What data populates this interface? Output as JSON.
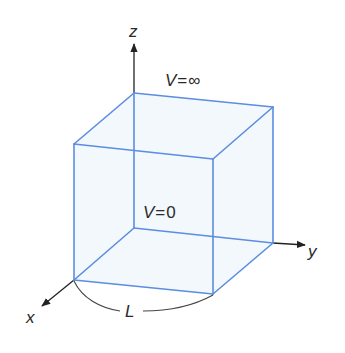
{
  "diagram": {
    "type": "3d-box-potential",
    "axes": {
      "x": {
        "label": "x"
      },
      "y": {
        "label": "y"
      },
      "z": {
        "label": "z"
      }
    },
    "labels": {
      "outside_potential_var": "V",
      "outside_potential_eq": "=",
      "outside_potential_val": "∞",
      "inside_potential_var": "V",
      "inside_potential_eq": "=",
      "inside_potential_val": "0",
      "side_length": "L"
    },
    "colors": {
      "edge": "#5b8de0",
      "face": "#eef5fc",
      "axis": "#222222",
      "text": "#2a2a2a"
    },
    "vertices": {
      "top_back_left": [
        134,
        93
      ],
      "top_back_right": [
        273,
        107
      ],
      "top_front_left": [
        74,
        144
      ],
      "top_front_right": [
        213,
        159
      ],
      "bottom_back_left": [
        134,
        228
      ],
      "bottom_back_right": [
        273,
        243
      ],
      "bottom_front_left": [
        74,
        280
      ],
      "bottom_front_right": [
        213,
        294
      ]
    }
  }
}
